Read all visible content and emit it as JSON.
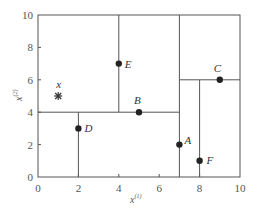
{
  "chart_data": {
    "type": "scatter",
    "title": "",
    "xlabel": "x",
    "xlabel_superscript": "(1)",
    "ylabel": "x",
    "ylabel_superscript": "(2)",
    "xlim": [
      0,
      10
    ],
    "ylim": [
      0,
      10
    ],
    "grid": false,
    "x_ticks": [
      0,
      2,
      4,
      6,
      8,
      10
    ],
    "y_ticks": [
      0,
      2,
      4,
      6,
      8,
      10
    ],
    "points": [
      {
        "label": "A",
        "x": 7,
        "y": 2
      },
      {
        "label": "B",
        "x": 5,
        "y": 4
      },
      {
        "label": "C",
        "x": 9,
        "y": 6
      },
      {
        "label": "D",
        "x": 2,
        "y": 3
      },
      {
        "label": "E",
        "x": 4,
        "y": 7
      },
      {
        "label": "F",
        "x": 8,
        "y": 1
      }
    ],
    "query_point": {
      "label": "x",
      "x": 1,
      "y": 5,
      "marker": "asterisk"
    },
    "partitions": [
      {
        "orientation": "vertical",
        "at": 7,
        "from": 0,
        "to": 10,
        "node": "A"
      },
      {
        "orientation": "horizontal",
        "at": 4,
        "from": 0,
        "to": 7,
        "node": "B"
      },
      {
        "orientation": "vertical",
        "at": 4,
        "from": 4,
        "to": 10,
        "node": "E"
      },
      {
        "orientation": "vertical",
        "at": 2,
        "from": 0,
        "to": 4,
        "node": "D"
      },
      {
        "orientation": "horizontal",
        "at": 6,
        "from": 7,
        "to": 10,
        "node": "C"
      },
      {
        "orientation": "vertical",
        "at": 8,
        "from": 0,
        "to": 6,
        "node": "F"
      }
    ]
  }
}
